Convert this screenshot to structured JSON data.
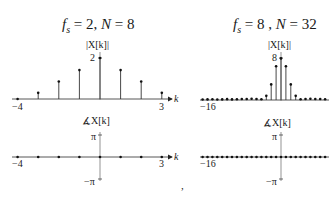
{
  "panels": [
    {
      "title": "f_s = 2, N = 8",
      "title_parts": {
        "fs_value": "2",
        "N_value": "8"
      },
      "magnitude": {
        "ylabel": "|X[k]|",
        "ytick": "2",
        "xlabel": "k",
        "xtick_left": "−4",
        "xtick_right": "3"
      },
      "phase": {
        "ylabel": "∡X[k]",
        "ytick_top": "π",
        "ytick_bottom": "−π",
        "xlabel": "k",
        "xtick_left": "−4",
        "xtick_right": "3"
      }
    },
    {
      "title": "f_s = 8 , N = 32",
      "title_parts": {
        "fs_value": "8",
        "N_value": "32"
      },
      "magnitude": {
        "ylabel": "|X[k]|",
        "ytick": "8",
        "xtick_left": "−16"
      },
      "phase": {
        "ylabel": "∡X[k]",
        "ytick_top": "π",
        "ytick_bottom": "−π",
        "xtick_left": "−16"
      }
    }
  ],
  "separator": ",",
  "chart_data": [
    {
      "type": "stem",
      "title": "f_s = 2, N = 8 — |X[k]|",
      "xlabel": "k",
      "ylabel": "|X[k]|",
      "x": [
        -4,
        -3,
        -2,
        -1,
        0,
        1,
        2,
        3
      ],
      "values": [
        0,
        0.3,
        0.85,
        1.41,
        2,
        1.41,
        0.85,
        0.3
      ],
      "ylim": [
        0,
        2
      ]
    },
    {
      "type": "stem",
      "title": "f_s = 2, N = 8 — ∡X[k]",
      "xlabel": "k",
      "ylabel": "∡X[k]",
      "x": [
        -4,
        -3,
        -2,
        -1,
        0,
        1,
        2,
        3
      ],
      "values": [
        0,
        0,
        0,
        0,
        0,
        0,
        0,
        0
      ],
      "ylim": [
        "-π",
        "π"
      ]
    },
    {
      "type": "stem",
      "title": "f_s = 8, N = 32 — |X[k]|",
      "xlabel": "k",
      "ylabel": "|X[k]|",
      "x": [
        -16,
        -15,
        -14,
        -13,
        -12,
        -11,
        -10,
        -9,
        -8,
        -7,
        -6,
        -5,
        -4,
        -3,
        -2,
        -1,
        0,
        1,
        2,
        3,
        4,
        5,
        6,
        7,
        8,
        9,
        10,
        11
      ],
      "values": [
        0.1,
        0.12,
        0.14,
        0.1,
        0.12,
        0.16,
        0.12,
        0.14,
        0.18,
        0.2,
        0.25,
        0.2,
        0.15,
        0.8,
        3.0,
        6.5,
        8,
        6.5,
        3.0,
        0.8,
        0.15,
        0.2,
        0.25,
        0.2,
        0.18,
        0.14,
        0.12,
        0.16
      ],
      "ylim": [
        0,
        8
      ]
    },
    {
      "type": "stem",
      "title": "f_s = 8, N = 32 — ∡X[k]",
      "xlabel": "k",
      "ylabel": "∡X[k]",
      "x_range": [
        -16,
        15
      ],
      "values_note": "all zero",
      "ylim": [
        "-π",
        "π"
      ]
    }
  ]
}
